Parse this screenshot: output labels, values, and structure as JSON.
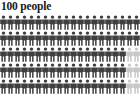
{
  "chart_data": {
    "type": "pictogram",
    "title": "100 people",
    "unit_label": "person",
    "total_units": 100,
    "rows": 5,
    "columns": 20,
    "icon_name": "person-icon",
    "categories": [
      "filled",
      "unfilled"
    ],
    "values": [
      94,
      6
    ],
    "series": [
      {
        "name": "filled",
        "value": 94,
        "color": "#3f3f3f"
      },
      {
        "name": "unfilled",
        "value": 6,
        "color": "#c8c8c8"
      }
    ],
    "grid": [
      [
        "filled",
        "filled",
        "filled",
        "filled",
        "filled",
        "filled",
        "filled",
        "filled",
        "filled",
        "filled",
        "filled",
        "filled",
        "filled",
        "filled",
        "filled",
        "filled",
        "filled",
        "filled",
        "filled",
        "filled"
      ],
      [
        "filled",
        "filled",
        "filled",
        "filled",
        "filled",
        "filled",
        "filled",
        "filled",
        "filled",
        "filled",
        "filled",
        "filled",
        "filled",
        "filled",
        "filled",
        "filled",
        "filled",
        "filled",
        "filled",
        "filled"
      ],
      [
        "filled",
        "filled",
        "filled",
        "filled",
        "filled",
        "filled",
        "filled",
        "filled",
        "filled",
        "filled",
        "filled",
        "filled",
        "filled",
        "filled",
        "filled",
        "filled",
        "filled",
        "filled",
        "unfilled",
        "unfilled"
      ],
      [
        "filled",
        "filled",
        "filled",
        "filled",
        "filled",
        "filled",
        "filled",
        "filled",
        "filled",
        "filled",
        "filled",
        "filled",
        "filled",
        "filled",
        "filled",
        "filled",
        "filled",
        "filled",
        "unfilled",
        "unfilled"
      ],
      [
        "filled",
        "filled",
        "filled",
        "filled",
        "filled",
        "filled",
        "filled",
        "filled",
        "filled",
        "filled",
        "filled",
        "filled",
        "filled",
        "filled",
        "filled",
        "filled",
        "filled",
        "filled",
        "unfilled",
        "unfilled"
      ]
    ],
    "xlabel": "",
    "ylabel": "",
    "legend": [],
    "grid_lines": false
  },
  "colors": {
    "background": "#ffffff",
    "title": "#1a1a1a",
    "filled": "#3f3f3f",
    "unfilled": "#c8c8c8"
  }
}
